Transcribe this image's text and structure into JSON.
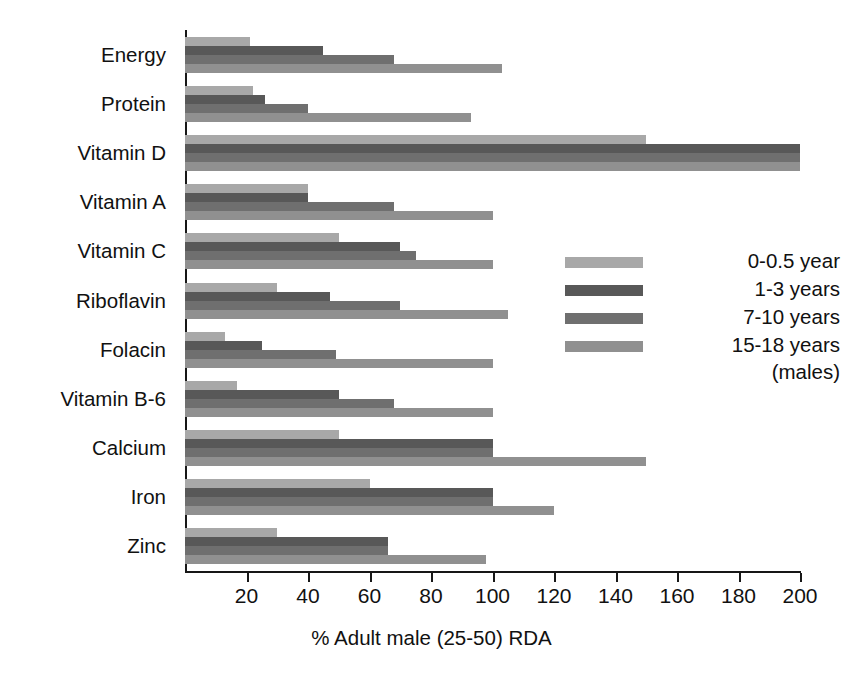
{
  "chart_data": {
    "type": "bar",
    "orientation": "horizontal",
    "title": "",
    "xlabel": "% Adult male (25-50) RDA",
    "ylabel": "",
    "xlim": [
      0,
      200
    ],
    "xticks": [
      20,
      40,
      60,
      80,
      100,
      120,
      140,
      160,
      180,
      200
    ],
    "xtick_labels": [
      "20",
      "40",
      "60",
      "80",
      "100",
      "120",
      "140",
      "160",
      "180",
      "200"
    ],
    "grid": false,
    "legend_position": "center-right",
    "categories": [
      "Energy",
      "Protein",
      "Vitamin D",
      "Vitamin A",
      "Vitamin C",
      "Riboflavin",
      "Folacin",
      "Vitamin B-6",
      "Calcium",
      "Iron",
      "Zinc"
    ],
    "series": [
      {
        "name": "0-0.5 year",
        "color": "#a8a8a8",
        "values": [
          21,
          22,
          150,
          40,
          50,
          30,
          13,
          17,
          50,
          60,
          30
        ]
      },
      {
        "name": "1-3 years",
        "color": "#585858",
        "values": [
          45,
          26,
          200,
          40,
          70,
          47,
          25,
          50,
          100,
          100,
          66
        ]
      },
      {
        "name": "7-10 years",
        "color": "#6f6f6f",
        "values": [
          68,
          40,
          200,
          68,
          75,
          70,
          49,
          68,
          100,
          100,
          66
        ]
      },
      {
        "name": "15-18 years (males)",
        "color": "#909090",
        "values": [
          103,
          93,
          200,
          100,
          100,
          105,
          100,
          100,
          150,
          120,
          98
        ]
      }
    ]
  },
  "legend": {
    "entries": [
      {
        "label": "0-0.5 year",
        "color": "#a8a8a8"
      },
      {
        "label": "1-3 years",
        "color": "#585858"
      },
      {
        "label": "7-10 years",
        "color": "#6f6f6f"
      },
      {
        "label": "15-18 years",
        "color": "#909090"
      }
    ],
    "sublabel": "(males)"
  },
  "colors": {
    "background": "#ffffff",
    "axis": "#171717",
    "text": "#111111"
  }
}
